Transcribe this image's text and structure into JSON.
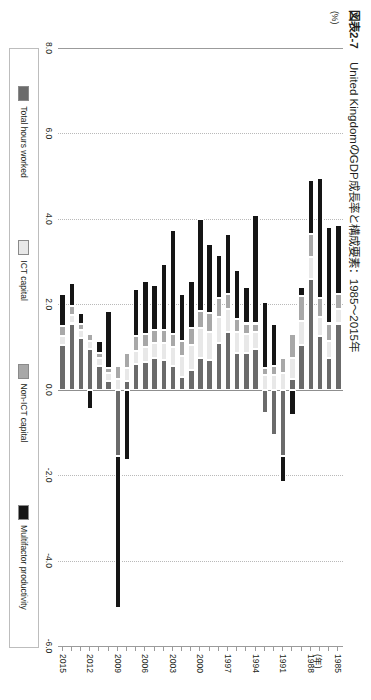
{
  "figure": {
    "tag": "図表2-7",
    "title": "United KingdomのGDP成長率と構成要素：1985〜2015年",
    "unit_label": "(%)",
    "year_axis_unit": "(年)"
  },
  "legend": {
    "position": "bottom",
    "items": [
      {
        "label": "Total hours worked",
        "color": "#6b6b6b"
      },
      {
        "label": "ICT capital",
        "color": "#e8e8e8"
      },
      {
        "label": "Non-ICT capital",
        "color": "#a8a8a8"
      },
      {
        "label": "Multifactor productivity",
        "color": "#151515"
      }
    ]
  },
  "chart_data": {
    "type": "bar",
    "subtype": "stacked-horizontal-rotated",
    "title": "United KingdomのGDP成長率と構成要素：1985〜2015年",
    "xlabel": "(年)",
    "ylabel": "(%)",
    "ylim": [
      -6.0,
      8.0
    ],
    "yticks": [
      "8.0",
      "6.0",
      "4.0",
      "2.0",
      "0.0",
      "-2.0",
      "-4.0",
      "-6.0"
    ],
    "ytick_values": [
      8.0,
      6.0,
      4.0,
      2.0,
      0.0,
      -2.0,
      -4.0,
      -6.0
    ],
    "grid": true,
    "xtick_labels": [
      "1985",
      "1988",
      "1991",
      "1994",
      "1997",
      "2000",
      "2003",
      "2006",
      "2009",
      "2012",
      "2015"
    ],
    "categories": [
      "1985",
      "1986",
      "1987",
      "1988",
      "1989",
      "1990",
      "1991",
      "1992",
      "1993",
      "1994",
      "1995",
      "1996",
      "1997",
      "1998",
      "1999",
      "2000",
      "2001",
      "2002",
      "2003",
      "2004",
      "2005",
      "2006",
      "2007",
      "2008",
      "2009",
      "2010",
      "2011",
      "2012",
      "2013",
      "2014",
      "2015"
    ],
    "series": [
      {
        "name": "Total hours worked",
        "color": "#6b6b6b",
        "values": [
          1.55,
          0.75,
          1.25,
          2.6,
          1.05,
          0.25,
          -1.55,
          -1.05,
          -0.55,
          0.95,
          0.85,
          0.85,
          1.35,
          1.1,
          0.7,
          0.75,
          0.45,
          0.3,
          0.55,
          0.7,
          0.75,
          0.65,
          0.6,
          0.2,
          -1.55,
          0.2,
          0.55,
          0.95,
          1.2,
          1.55,
          1.05
        ]
      },
      {
        "name": "ICT capital",
        "color": "#e8e8e8",
        "values": [
          0.35,
          0.4,
          0.45,
          0.5,
          0.55,
          0.5,
          0.4,
          0.35,
          0.35,
          0.4,
          0.45,
          0.5,
          0.55,
          0.6,
          0.65,
          0.7,
          0.6,
          0.5,
          0.45,
          0.4,
          0.35,
          0.35,
          0.3,
          0.3,
          0.25,
          0.2,
          0.2,
          0.2,
          0.2,
          0.2,
          0.2
        ]
      },
      {
        "name": "Non-ICT capital",
        "color": "#a8a8a8",
        "values": [
          0.35,
          0.4,
          0.45,
          0.55,
          0.6,
          0.55,
          0.35,
          0.2,
          0.15,
          0.2,
          0.25,
          0.3,
          0.35,
          0.45,
          0.45,
          0.4,
          0.4,
          0.35,
          0.3,
          0.3,
          0.3,
          0.3,
          0.35,
          0.35,
          0.3,
          0.1,
          0.1,
          0.15,
          0.15,
          0.2,
          0.25
        ]
      },
      {
        "name": "Multifactor productivity",
        "color": "#151515",
        "values": [
          1.6,
          2.25,
          2.8,
          1.25,
          0.2,
          -0.6,
          -0.6,
          1.0,
          1.55,
          2.55,
          0.85,
          1.15,
          1.4,
          1.0,
          1.6,
          2.15,
          1.1,
          1.1,
          2.45,
          1.55,
          1.05,
          1.25,
          1.1,
          -1.65,
          -3.55,
          1.35,
          0.3,
          -0.45,
          0.25,
          0.55,
          0.75
        ]
      }
    ],
    "totals": [
      3.85,
      3.8,
      4.95,
      4.9,
      2.4,
      0.7,
      -1.4,
      0.5,
      1.5,
      4.1,
      2.4,
      2.8,
      3.65,
      3.15,
      3.4,
      4.0,
      2.55,
      2.25,
      3.75,
      2.95,
      2.45,
      2.55,
      2.35,
      -0.8,
      -4.55,
      1.85,
      1.15,
      0.85,
      1.8,
      2.5,
      2.25
    ]
  }
}
